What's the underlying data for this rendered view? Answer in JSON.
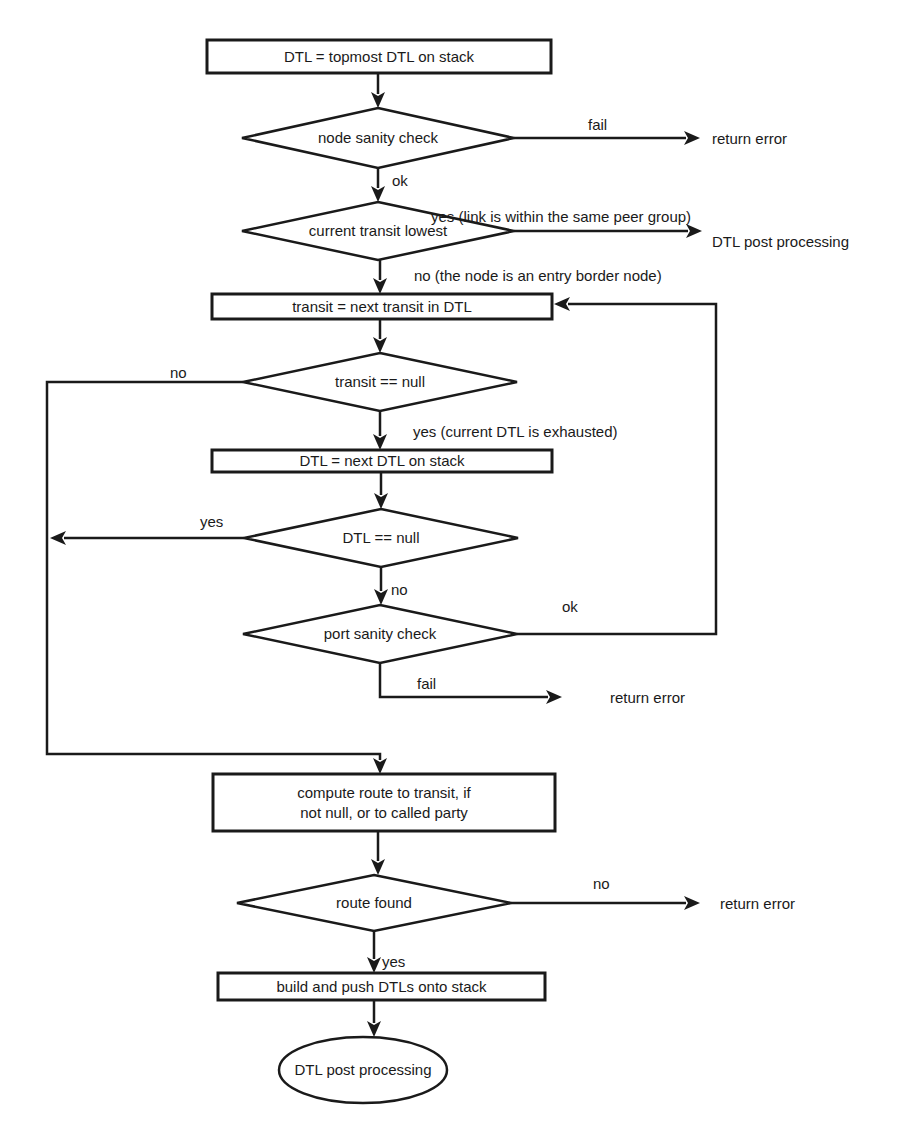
{
  "diagram": {
    "type": "flowchart",
    "nodes": [
      {
        "id": "start",
        "kind": "process",
        "label": [
          "DTL = topmost DTL on stack"
        ],
        "x": 207,
        "y": 40,
        "w": 344,
        "h": 33
      },
      {
        "id": "node_sanity",
        "kind": "decision",
        "label": [
          "node sanity check"
        ],
        "cx": 378,
        "cy": 138,
        "hw": 136,
        "hh": 30
      },
      {
        "id": "transit_lowest",
        "kind": "decision",
        "label": [
          "current transit lowest"
        ],
        "cx": 378,
        "cy": 231,
        "hw": 136,
        "hh": 29
      },
      {
        "id": "next_transit",
        "kind": "process",
        "label": [
          "transit = next transit in DTL"
        ],
        "x": 212,
        "y": 294,
        "w": 340,
        "h": 25
      },
      {
        "id": "transit_null",
        "kind": "decision",
        "label": [
          "transit == null"
        ],
        "cx": 380,
        "cy": 382,
        "hw": 137,
        "hh": 29
      },
      {
        "id": "next_dtl",
        "kind": "process",
        "label": [
          "DTL = next DTL on stack"
        ],
        "x": 212,
        "y": 450,
        "w": 340,
        "h": 22
      },
      {
        "id": "dtl_null",
        "kind": "decision",
        "label": [
          "DTL == null"
        ],
        "cx": 381,
        "cy": 538,
        "hw": 137,
        "hh": 29
      },
      {
        "id": "port_sanity",
        "kind": "decision",
        "label": [
          "port sanity check"
        ],
        "cx": 380,
        "cy": 634,
        "hw": 137,
        "hh": 29
      },
      {
        "id": "compute_route",
        "kind": "process",
        "label": [
          "compute route to transit, if",
          "not null, or to called party"
        ],
        "x": 213,
        "y": 774,
        "w": 342,
        "h": 57
      },
      {
        "id": "route_found",
        "kind": "decision",
        "label": [
          "route found"
        ],
        "cx": 374,
        "cy": 903,
        "hw": 137,
        "hh": 28
      },
      {
        "id": "build_push",
        "kind": "process",
        "label": [
          "build and push DTLs  onto stack"
        ],
        "x": 218,
        "y": 973,
        "w": 327,
        "h": 27
      },
      {
        "id": "post_processing",
        "kind": "terminal",
        "label": [
          "DTL post processing"
        ],
        "cx": 363,
        "cy": 1070,
        "rx": 84,
        "ry": 33
      }
    ],
    "outcomes": [
      {
        "id": "err1",
        "text": "return error",
        "x": 712,
        "y": 144
      },
      {
        "id": "post1",
        "text": "DTL post processing",
        "x": 712,
        "y": 247
      },
      {
        "id": "err2",
        "text": "return error",
        "x": 610,
        "y": 703
      },
      {
        "id": "err3",
        "text": "return error",
        "x": 720,
        "y": 909
      }
    ],
    "edge_labels": [
      {
        "id": "lbl_fail1",
        "text": "fail",
        "x": 588,
        "y": 130
      },
      {
        "id": "lbl_ok1",
        "text": "ok",
        "x": 392,
        "y": 186
      },
      {
        "id": "lbl_yes_peer",
        "text": "yes (link is within the same peer group)",
        "x": 431,
        "y": 222
      },
      {
        "id": "lbl_no_entry",
        "text": "no (the node is an entry border node)",
        "x": 414,
        "y": 281
      },
      {
        "id": "lbl_no_transit",
        "text": "no",
        "x": 170,
        "y": 378
      },
      {
        "id": "lbl_yes_exhausted",
        "text": "yes (current DTL is exhausted)",
        "x": 413,
        "y": 437
      },
      {
        "id": "lbl_yes_dtl",
        "text": "yes",
        "x": 200,
        "y": 527
      },
      {
        "id": "lbl_no_dtl",
        "text": "no",
        "x": 391,
        "y": 595
      },
      {
        "id": "lbl_ok_port",
        "text": "ok",
        "x": 562,
        "y": 612
      },
      {
        "id": "lbl_fail_port",
        "text": "fail",
        "x": 417,
        "y": 689
      },
      {
        "id": "lbl_no_route",
        "text": "no",
        "x": 593,
        "y": 889
      },
      {
        "id": "lbl_yes_route",
        "text": "yes",
        "x": 382,
        "y": 967
      }
    ],
    "edges": [
      {
        "id": "e1",
        "points": [
          [
            378,
            73
          ],
          [
            378,
            108
          ]
        ],
        "arrow": true
      },
      {
        "id": "e2",
        "points": [
          [
            514,
            138
          ],
          [
            700,
            138
          ]
        ],
        "arrow": true
      },
      {
        "id": "e3",
        "points": [
          [
            378,
            168
          ],
          [
            378,
            202
          ]
        ],
        "arrow": true
      },
      {
        "id": "e4",
        "points": [
          [
            514,
            231
          ],
          [
            702,
            231
          ]
        ],
        "arrow": true
      },
      {
        "id": "e5",
        "points": [
          [
            380,
            260
          ],
          [
            380,
            294
          ]
        ],
        "arrow": true
      },
      {
        "id": "e6",
        "points": [
          [
            380,
            319
          ],
          [
            380,
            353
          ]
        ],
        "arrow": true
      },
      {
        "id": "e7",
        "points": [
          [
            380,
            411
          ],
          [
            380,
            450
          ]
        ],
        "arrow": true
      },
      {
        "id": "e8",
        "points": [
          [
            381,
            472
          ],
          [
            381,
            509
          ]
        ],
        "arrow": true
      },
      {
        "id": "e9",
        "points": [
          [
            244,
            538
          ],
          [
            50,
            538
          ]
        ],
        "arrow": true
      },
      {
        "id": "e10",
        "points": [
          [
            381,
            567
          ],
          [
            381,
            605
          ]
        ],
        "arrow": true
      },
      {
        "id": "e11",
        "points": [
          [
            517,
            634
          ],
          [
            716,
            634
          ],
          [
            716,
            304
          ],
          [
            554,
            304
          ]
        ],
        "arrow": true
      },
      {
        "id": "e12",
        "points": [
          [
            380,
            663
          ],
          [
            380,
            697
          ],
          [
            562,
            697
          ]
        ],
        "arrow": true
      },
      {
        "id": "e13",
        "points": [
          [
            243,
            382
          ],
          [
            47,
            382
          ],
          [
            47,
            754
          ],
          [
            380,
            754
          ],
          [
            380,
            774
          ]
        ],
        "arrow": true
      },
      {
        "id": "e14",
        "points": [
          [
            378,
            831
          ],
          [
            378,
            875
          ]
        ],
        "arrow": true
      },
      {
        "id": "e15",
        "points": [
          [
            511,
            903
          ],
          [
            700,
            903
          ]
        ],
        "arrow": true
      },
      {
        "id": "e16",
        "points": [
          [
            374,
            931
          ],
          [
            374,
            973
          ]
        ],
        "arrow": true
      },
      {
        "id": "e17",
        "points": [
          [
            374,
            1000
          ],
          [
            374,
            1037
          ]
        ],
        "arrow": true
      }
    ]
  }
}
